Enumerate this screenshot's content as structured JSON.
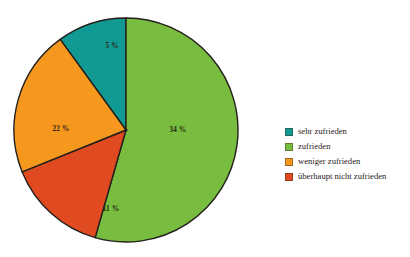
{
  "chart_data": {
    "type": "pie",
    "title": "",
    "subtitle": "",
    "xlabel": "",
    "ylabel": "",
    "grid": false,
    "legend_position": "right",
    "value_suffix": "%",
    "categories": [
      "sehr zufrieden",
      "zufrieden",
      "weniger zufrieden",
      "überhaupt nicht zufrieden"
    ],
    "values": [
      5,
      34,
      22,
      11
    ],
    "labels": [
      "5 %",
      "34 %",
      "22 %",
      "11 %"
    ],
    "colors": [
      "#119a93",
      "#78bd3f",
      "#f6981e",
      "#e04a20"
    ],
    "slices": [
      {
        "name": "sehr zufrieden",
        "value": 5,
        "label": "5 %",
        "color": "#119a93",
        "drawn_start_deg": 324,
        "drawn_end_deg": 360,
        "label_x": 99,
        "label_y": 29
      },
      {
        "name": "zufrieden",
        "value": 34,
        "label": "34 %",
        "color": "#78bd3f",
        "drawn_start_deg": 0,
        "drawn_end_deg": 196,
        "label_x": 165,
        "label_y": 113
      },
      {
        "name": "überhaupt nicht zufrieden",
        "value": 11,
        "label": "11 %",
        "color": "#e04a20",
        "drawn_start_deg": 196,
        "drawn_end_deg": 248,
        "label_x": 98,
        "label_y": 192
      },
      {
        "name": "weniger zufrieden",
        "value": 22,
        "label": "22 %",
        "color": "#f6981e",
        "drawn_start_deg": 248,
        "drawn_end_deg": 324,
        "label_x": 48,
        "label_y": 112
      }
    ],
    "geometry": {
      "center_x": 113,
      "center_y": 113,
      "radius": 112,
      "outline_color": "#231f1c"
    }
  },
  "legend": {
    "items": [
      {
        "label": "sehr zufrieden",
        "color": "#119a93"
      },
      {
        "label": "zufrieden",
        "color": "#78bd3f"
      },
      {
        "label": "weniger zufrieden",
        "color": "#f6981e"
      },
      {
        "label": "überhaupt nicht zufrieden",
        "color": "#e04a20"
      }
    ]
  }
}
